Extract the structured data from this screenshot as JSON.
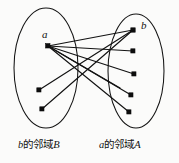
{
  "figure": {
    "type": "bipartite-neighborhood-diagram",
    "background_color": "#fbfbfa",
    "ink_color": "#111111",
    "captions": {
      "left": {
        "prefix": "b",
        "middle": "的邻域",
        "suffix": "B",
        "full": "b的邻域B"
      },
      "right": {
        "prefix": "a",
        "middle": "的邻域",
        "suffix": "A",
        "full": "a的邻域A"
      }
    },
    "node_labels": {
      "a": "a",
      "b": "b"
    },
    "ellipses": [
      {
        "name": "left-set-B",
        "cx": 46,
        "cy": 68,
        "rx": 32,
        "ry": 60
      },
      {
        "name": "right-set-A",
        "cx": 136,
        "cy": 71,
        "rx": 28,
        "ry": 57
      }
    ],
    "nodes": [
      {
        "id": "a",
        "x": 48,
        "y": 46,
        "set": "left",
        "labeled": true
      },
      {
        "id": "l2",
        "x": 39,
        "y": 90,
        "set": "left",
        "labeled": false
      },
      {
        "id": "l3",
        "x": 42,
        "y": 109,
        "set": "left",
        "labeled": false
      },
      {
        "id": "b",
        "x": 133,
        "y": 30,
        "set": "right",
        "labeled": true
      },
      {
        "id": "r2",
        "x": 133,
        "y": 51,
        "set": "right",
        "labeled": false
      },
      {
        "id": "r3",
        "x": 134,
        "y": 74,
        "set": "right",
        "labeled": false
      },
      {
        "id": "r4",
        "x": 131,
        "y": 95,
        "set": "right",
        "labeled": false
      },
      {
        "id": "r5",
        "x": 129,
        "y": 112,
        "set": "right",
        "labeled": false
      }
    ],
    "edges": [
      {
        "from": "a",
        "to": "b"
      },
      {
        "from": "a",
        "to": "r2"
      },
      {
        "from": "a",
        "to": "r3"
      },
      {
        "from": "a",
        "to": "r4"
      },
      {
        "from": "a",
        "to": "r5"
      },
      {
        "from": "l2",
        "to": "b"
      },
      {
        "from": "l3",
        "to": "b"
      },
      {
        "from": "a",
        "to": "r3b"
      }
    ]
  }
}
